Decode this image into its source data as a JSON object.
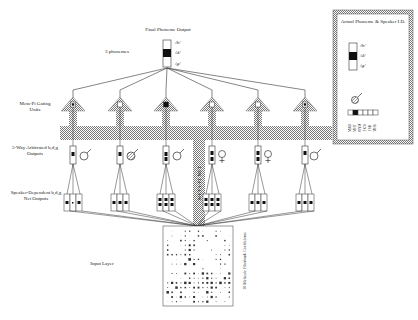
{
  "title": "Final Phoneme Output",
  "labels": {
    "phonemes": "3 phonemes",
    "gating": "Meta-Pi Gating Units",
    "arbitrated": "5-Way Arbitrated b,d,g Outputs",
    "speaker_dependent": "Speaker-Dependent b,d,g Net Outputs",
    "meta_pi_net": "META-PI NET",
    "input_layer": "Input Layer",
    "coefficients": "16 Melscale Filterbank Coefficients"
  },
  "output_phonemes": [
    "/b/",
    "/d/",
    "/g/"
  ],
  "legend": {
    "title": "Actual Phoneme & Speaker I.D.",
    "phonemes": [
      "/b/",
      "/d/",
      "/g/"
    ],
    "active_phoneme_index": 1,
    "speakers": [
      "MAU",
      "MHT",
      "MNM",
      "FKN",
      "FSU",
      "MHS"
    ],
    "active_speaker_index": 1
  },
  "modules": [
    {
      "gender": "male",
      "symbol_fill": "open"
    },
    {
      "gender": "male",
      "symbol_fill": "hatched"
    },
    {
      "gender": "male",
      "symbol_fill": "open"
    },
    {
      "gender": "female",
      "symbol_fill": "open"
    },
    {
      "gender": "female",
      "symbol_fill": "open"
    },
    {
      "gender": "male",
      "symbol_fill": "open"
    }
  ]
}
